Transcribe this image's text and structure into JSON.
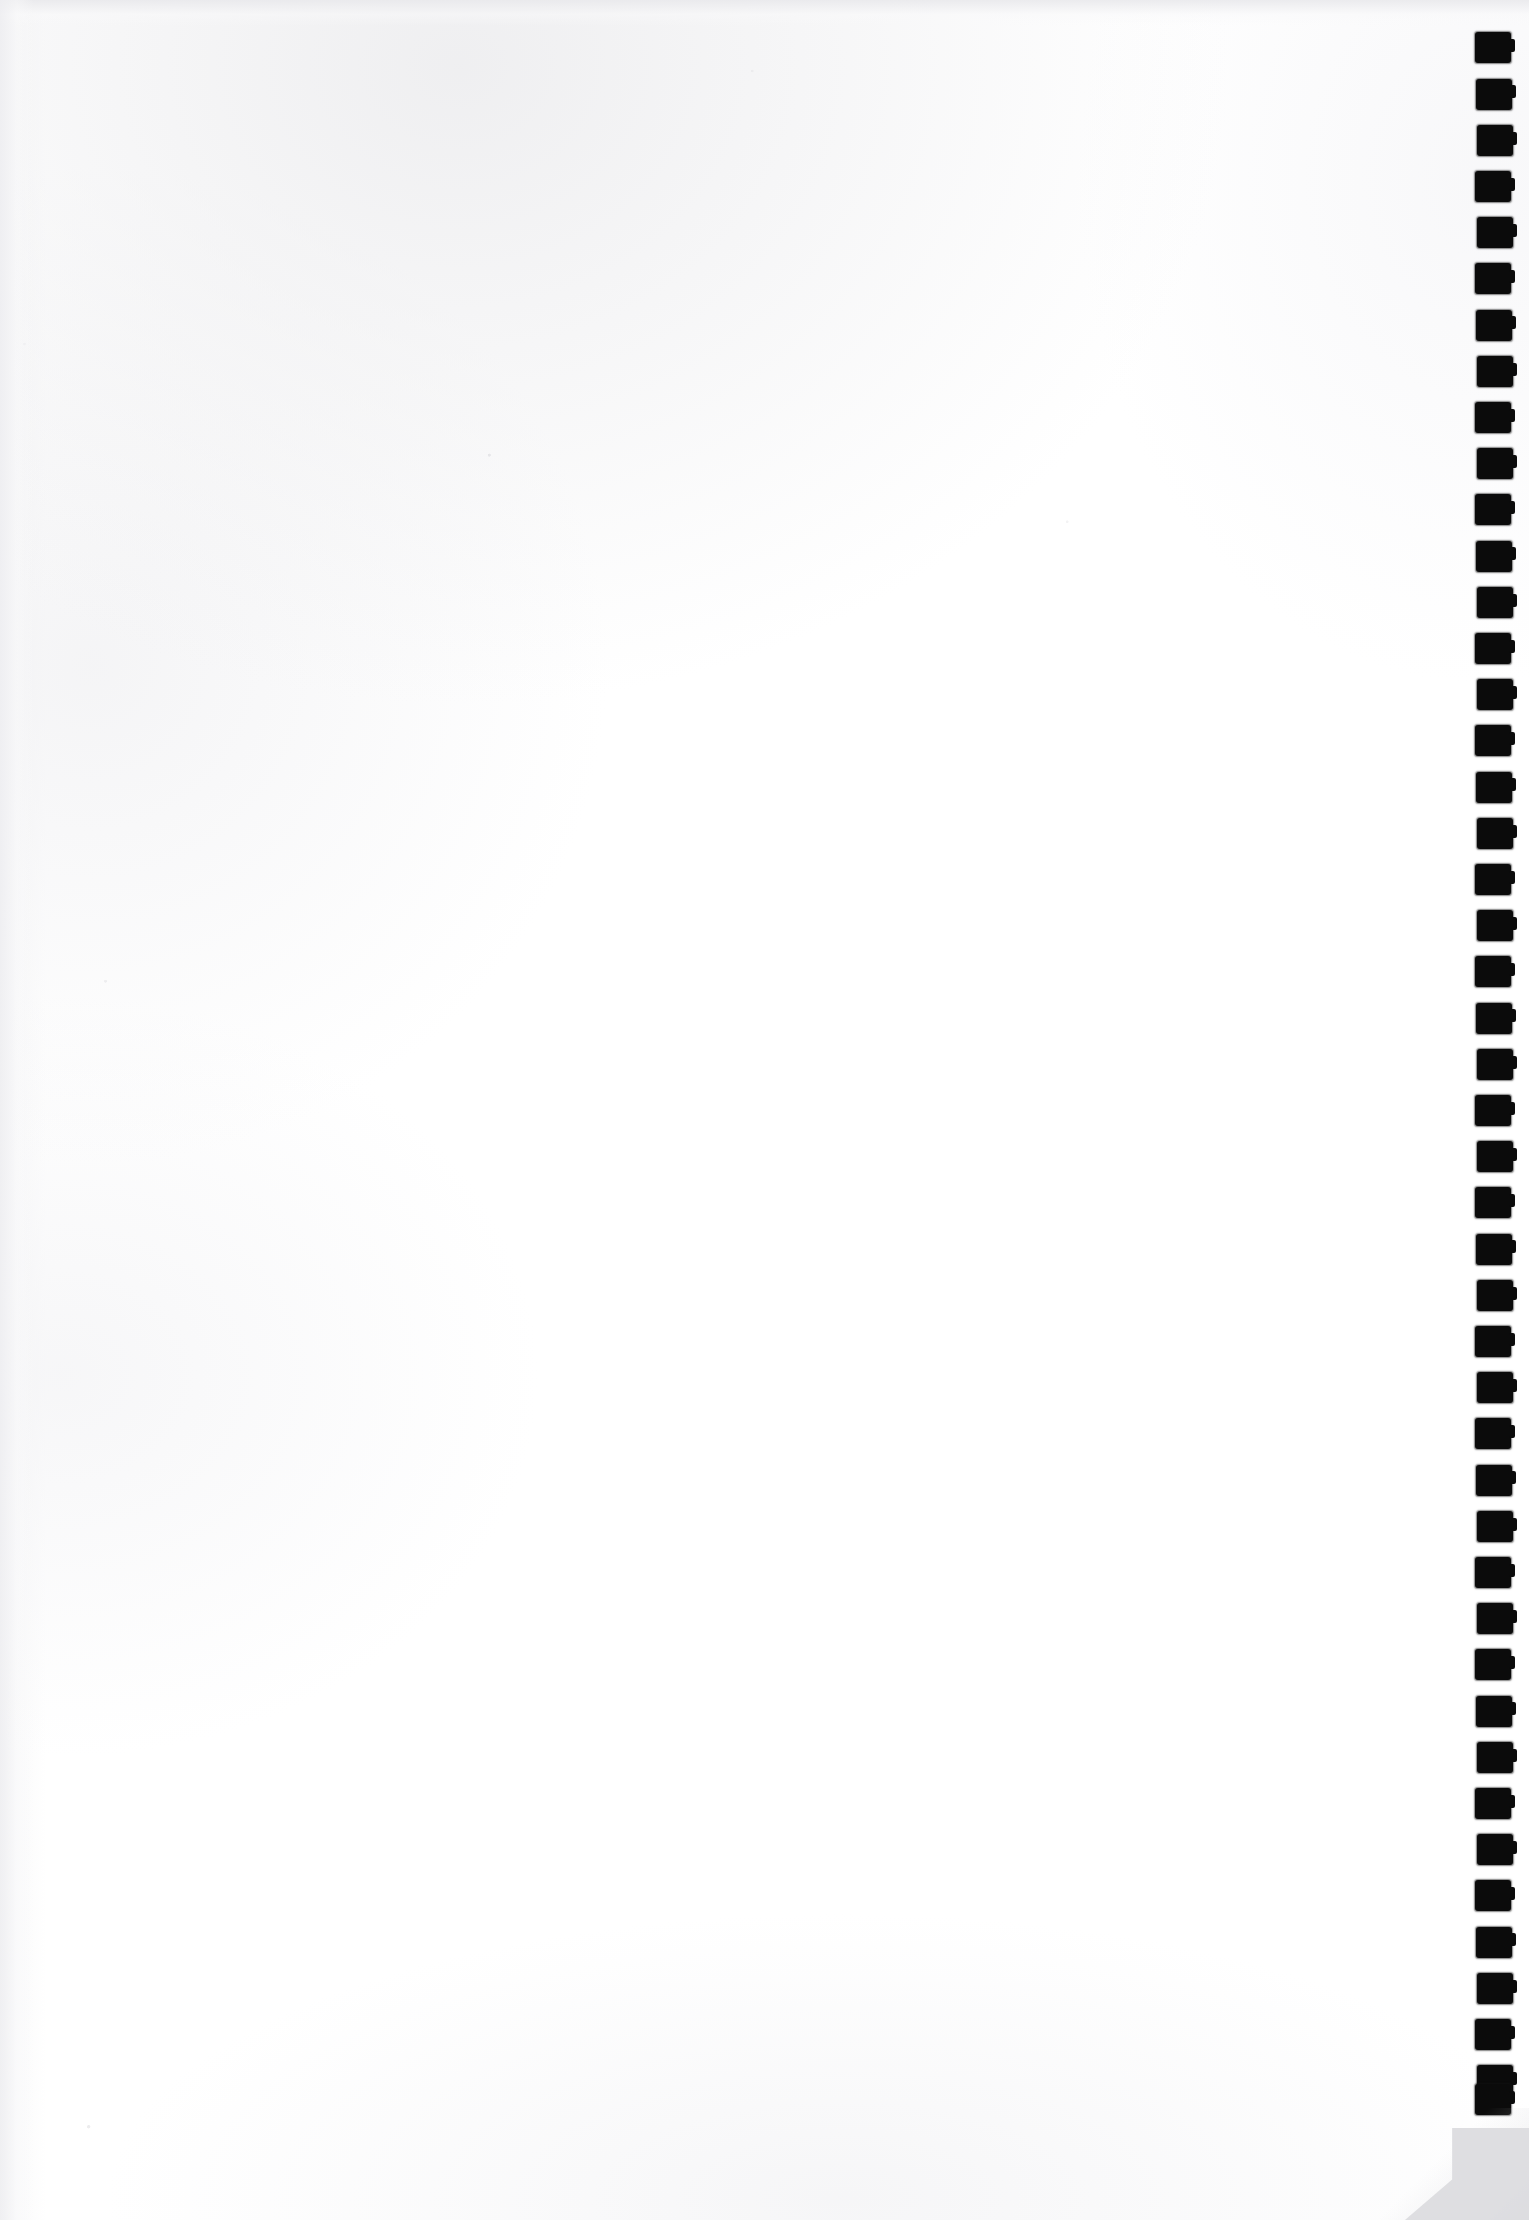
{
  "document": {
    "kind": "scanned-page",
    "page_label": "",
    "body_text": "",
    "notes": ""
  },
  "canvas": {
    "width": 1529,
    "height": 2220,
    "paper_color": "#ffffff",
    "ink_color": "#0b0b0b",
    "scanner_background_color": "#dcdcdf",
    "edge_shade_color": "#eeeef1"
  },
  "registration_marks": {
    "name": "edge-registration-marks",
    "count": 32,
    "shape": "square",
    "color": "#0b0b0b",
    "left": 1476,
    "width": 36,
    "height": 31,
    "first_top": 33,
    "pitch": 46.2,
    "tops": [
      33,
      79.2,
      125.4,
      171.6,
      217.8,
      264,
      310.2,
      356.4,
      402.6,
      448.8,
      495,
      541.2,
      587.4,
      633.6,
      679.8,
      726,
      772.2,
      818.4,
      864.6,
      910.8,
      957,
      1003.2,
      1049.4,
      1095.6,
      1141.8,
      1188,
      1234.2,
      1280.4,
      1326.6,
      1372.8,
      1419,
      1465.2
    ]
  },
  "registration_marks_lower": {
    "name": "edge-registration-marks-lower",
    "count": 14,
    "tops": [
      1511.4,
      1557.6,
      1603.8,
      1650,
      1696.2,
      1742.4,
      1788.6,
      1834.8,
      1881,
      1927.2,
      1973.4,
      2019.6,
      2065.8,
      2085
    ]
  },
  "corner": {
    "name": "page-corner-shadow",
    "position": "bottom-right",
    "color": "#dcdcdf"
  }
}
